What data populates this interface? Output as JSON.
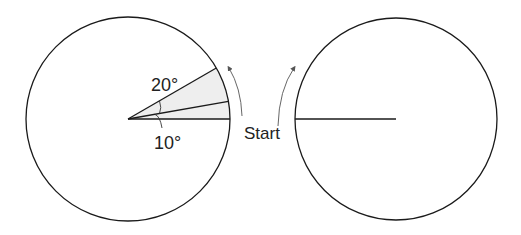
{
  "diagram": {
    "type": "rotating-disk-illustration",
    "colors": {
      "stroke": "#1a1a1a",
      "arrow": "#555555",
      "sector_fill": "#eeeeee",
      "text": "#222222"
    },
    "left_disk": {
      "center": [
        128,
        119
      ],
      "radius": 102,
      "sector_angles_deg": [
        0,
        10,
        30
      ],
      "labels": {
        "upper_angle": "20°",
        "lower_angle": "10°"
      }
    },
    "right_disk": {
      "center": [
        396,
        119
      ],
      "radius": 101
    },
    "start_label": "Start"
  }
}
